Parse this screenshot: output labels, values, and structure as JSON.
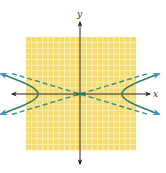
{
  "diagram": {
    "type": "hyperbola",
    "labels": {
      "x_axis": "x",
      "y_axis": "y"
    },
    "colors": {
      "grid_fill": "#f6dc6e",
      "grid_line": "#fbf1c4",
      "axis": "#222222",
      "curve": "#2f7f73",
      "curve_arrow": "#3a8fd8",
      "asymptote": "#2f8f8a",
      "center_dot": "#2f7f73"
    },
    "grid": {
      "left": 26,
      "top": 37,
      "width": 110,
      "height": 113,
      "cells": 20
    },
    "origin": {
      "x": 80,
      "y": 94
    },
    "vertex_offset_px": 42,
    "asymptote_slope": 0.3
  }
}
